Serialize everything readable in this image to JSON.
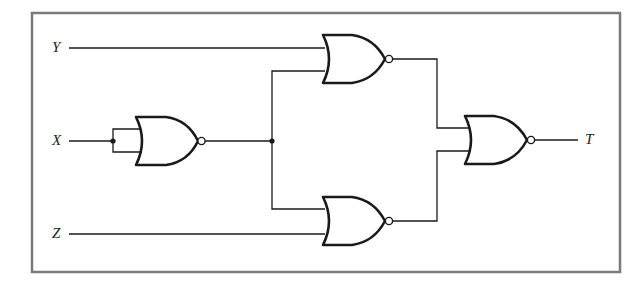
{
  "diagram": {
    "type": "logic-circuit",
    "frame_color": "#7a7a7a",
    "wire_color": "#1a1a1a",
    "inputs": [
      {
        "id": "Y",
        "label": "Y"
      },
      {
        "id": "X",
        "label": "X"
      },
      {
        "id": "Z",
        "label": "Z"
      }
    ],
    "outputs": [
      {
        "id": "T",
        "label": "T"
      }
    ],
    "gates": [
      {
        "id": "g1",
        "type": "NOR",
        "inputs": [
          "X",
          "X"
        ],
        "output": "n1"
      },
      {
        "id": "g2",
        "type": "NOR",
        "inputs": [
          "Y",
          "n1"
        ],
        "output": "n2"
      },
      {
        "id": "g3",
        "type": "NOR",
        "inputs": [
          "n1",
          "Z"
        ],
        "output": "n3"
      },
      {
        "id": "g4",
        "type": "NOR",
        "inputs": [
          "n2",
          "n3"
        ],
        "output": "T"
      }
    ]
  }
}
